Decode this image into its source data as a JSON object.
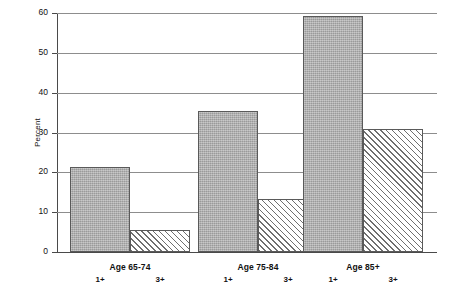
{
  "chart_data": {
    "type": "bar",
    "title": "",
    "subtitle": "",
    "xlabel": "",
    "ylabel": "Percent",
    "ylim": [
      0,
      60
    ],
    "yticks": [
      0,
      10,
      20,
      30,
      40,
      50,
      60
    ],
    "ytick_labels": [
      "0",
      "10",
      "20",
      "30",
      "40",
      "50",
      "60"
    ],
    "grid": true,
    "legend_position": "none",
    "categories": [
      "Age 65-74",
      "Age 75-84",
      "Age 85+"
    ],
    "subcategories": [
      "1+",
      "3+"
    ],
    "series": [
      {
        "name": "1+",
        "style": "solid-gray",
        "values": [
          21.3,
          35.5,
          59.3
        ]
      },
      {
        "name": "3+",
        "style": "diagonal-hatch",
        "values": [
          5.5,
          13.2,
          30.9
        ]
      }
    ],
    "bars": [
      {
        "group": "Age 65-74",
        "sub": "1+",
        "value": 21.3,
        "style": "solid"
      },
      {
        "group": "Age 65-74",
        "sub": "3+",
        "value": 5.5,
        "style": "hatched"
      },
      {
        "group": "Age 75-84",
        "sub": "1+",
        "value": 35.5,
        "style": "solid"
      },
      {
        "group": "Age 75-84",
        "sub": "3+",
        "value": 13.2,
        "style": "hatched"
      },
      {
        "group": "Age 85+",
        "sub": "1+",
        "value": 59.3,
        "style": "solid"
      },
      {
        "group": "Age 85+",
        "sub": "3+",
        "value": 30.9,
        "style": "hatched"
      }
    ],
    "colors": {
      "solid_fill": "#a9a9a9",
      "hatch_line": "#6f6f6f",
      "hatch_background": "#ffffff",
      "bar_border": "#5a5a5a",
      "gridline": "#8d8d8d",
      "axis": "#4a4a4a",
      "background": "#ffffff",
      "text": "#111111"
    }
  },
  "axis": {
    "y_title": "Percent",
    "ticks": [
      {
        "label": "60"
      },
      {
        "label": "50"
      },
      {
        "label": "40"
      },
      {
        "label": "30"
      },
      {
        "label": "20"
      },
      {
        "label": "10"
      },
      {
        "label": "0"
      }
    ]
  },
  "groups": [
    {
      "label": "Age 65-74",
      "sub_left": "1+",
      "sub_right": "3+"
    },
    {
      "label": "Age 75-84",
      "sub_left": "1+",
      "sub_right": "3+"
    },
    {
      "label": "Age 85+",
      "sub_left": "1+",
      "sub_right": "3+"
    }
  ]
}
